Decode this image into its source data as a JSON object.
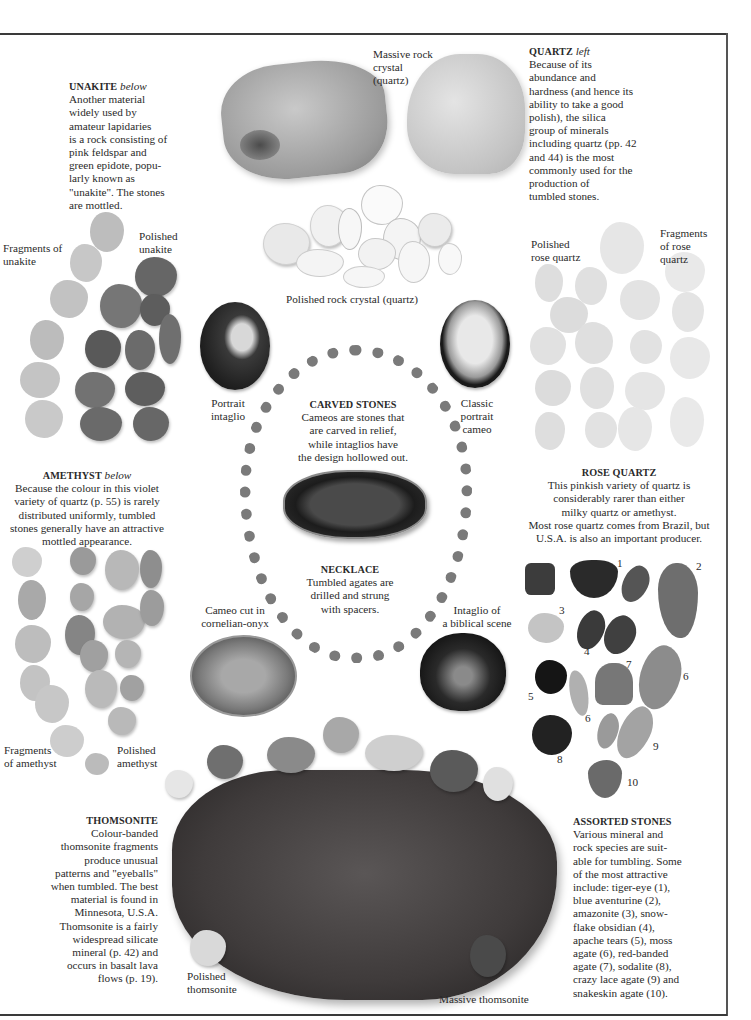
{
  "page": {
    "sections": {
      "unakite": {
        "heading": "UNAKITE",
        "subheading": "below",
        "lines": [
          "Another material",
          "widely used by",
          "amateur lapidaries",
          "is a rock consisting of",
          "pink feldspar and",
          "green epidote, popu-",
          "larly known as",
          "\"unakite\". The stones",
          "are mottled."
        ]
      },
      "quartz": {
        "heading": "QUARTZ",
        "subheading": "left",
        "lines": [
          "Because of its",
          "abundance and",
          "hardness (and hence its",
          "ability to take a good",
          "polish), the silica",
          "group of minerals",
          "including quartz (pp. 42",
          "and 44) is the most",
          "commonly used for the",
          "production of",
          "tumbled stones."
        ]
      },
      "amethyst": {
        "heading": "AMETHYST",
        "subheading": "below",
        "lines": [
          "Because the colour in this violet",
          "variety of quartz (p. 55) is rarely",
          "distributed uniformly, tumbled",
          "stones generally have an attractive",
          "mottled appearance."
        ]
      },
      "rose_quartz": {
        "heading": "ROSE QUARTZ",
        "lines": [
          "This pinkish variety of quartz is",
          "considerably rarer than either",
          "milky quartz or amethyst.",
          "Most rose quartz comes from Brazil, but",
          "U.S.A. is also an important producer."
        ]
      },
      "carved_stones": {
        "heading": "CARVED STONES",
        "lines": [
          "Cameos are stones that",
          "are carved in relief,",
          "while intaglios have",
          "the design hollowed out."
        ]
      },
      "necklace": {
        "heading": "NECKLACE",
        "lines": [
          "Tumbled agates are",
          "drilled and strung",
          "with spacers."
        ]
      },
      "thomsonite": {
        "heading": "THOMSONITE",
        "lines": [
          "Colour-banded",
          "thomsonite fragments",
          "produce unusual",
          "patterns and \"eyeballs\"",
          "when tumbled. The best",
          "material is found in",
          "Minnesota, U.S.A.",
          "Thomsonite is a fairly",
          "widespread silicate",
          "mineral (p. 42) and",
          "occurs in basalt lava",
          "flows (p. 19)."
        ]
      },
      "assorted_stones": {
        "heading": "ASSORTED STONES",
        "lines": [
          "Various mineral and",
          "rock species are suit-",
          "able for tumbling. Some",
          "of the most attractive",
          "include: tiger-eye (1),",
          "blue aventurine (2),",
          "amazonite (3), snow-",
          "flake obsidian (4),",
          "apache tears (5), moss",
          "agate (6), red-banded",
          "agate (7), sodalite (8),",
          "crazy lace agate (9) and",
          "snakeskin agate (10)."
        ]
      }
    },
    "labels": {
      "massive_rock_crystal": [
        "Massive rock",
        "crystal",
        "(quartz)"
      ],
      "polished_rock_crystal": "Polished rock crystal (quartz)",
      "fragments_unakite": [
        "Fragments of",
        "unakite"
      ],
      "polished_unakite": [
        "Polished",
        "unakite"
      ],
      "polished_rose_quartz": [
        "Polished",
        "rose quartz"
      ],
      "fragments_rose_quartz": [
        "Fragments",
        "of rose",
        "quartz"
      ],
      "portrait_intaglio": [
        "Portrait",
        "intaglio"
      ],
      "classic_portrait_cameo": [
        "Classic",
        "portrait",
        "cameo"
      ],
      "cameo_cornelian": [
        "Cameo cut in",
        "cornelian-onyx"
      ],
      "intaglio_biblical": [
        "Intaglio of",
        "a biblical scene"
      ],
      "fragments_amethyst": [
        "Fragments",
        "of amethyst"
      ],
      "polished_amethyst": [
        "Polished",
        "amethyst"
      ],
      "polished_thomsonite": [
        "Polished",
        "thomsonite"
      ],
      "massive_thomsonite": "Massive thomsonite"
    },
    "stone_numbers": [
      "1",
      "2",
      "3",
      "4",
      "5",
      "6",
      "6",
      "7",
      "8",
      "9",
      "10"
    ],
    "colors": {
      "text": "#2a2a2a",
      "rule": "#3a3a3a",
      "thomsonite": "#4a4646",
      "quartz": "#cfcfcf",
      "rose_quartz": "#e2e2e2"
    }
  }
}
